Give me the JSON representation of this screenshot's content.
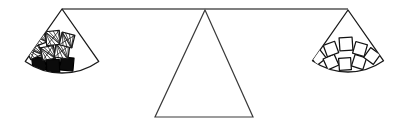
{
  "figure": {
    "background_color": "#ffffff",
    "line_color": "#1a1a1a",
    "fill_black": "#0b0b0b",
    "fill_white": "#ffffff"
  },
  "beam": {
    "label": "balance-beam",
    "left_end_x": 62,
    "right_end_x": 348,
    "y": 9,
    "tilt": "level"
  },
  "fulcrum": {
    "label": "fulcrum-triangle",
    "apex_x": 205,
    "apex_y": 10,
    "base_left_x": 155,
    "base_right_x": 253,
    "base_y": 117
  },
  "pans": [
    {
      "id": "left-pan",
      "label": "Left pan",
      "side": "left",
      "apex_x": 62,
      "apex_y": 9,
      "radius": 64,
      "start_angle_deg": 125,
      "end_angle_deg": 55,
      "block_count": 9,
      "black_block_count": 3,
      "hatched_block_count": 6,
      "blocks": [
        {
          "id": "L1",
          "fill": "black",
          "cx": 39,
          "cy": 64,
          "size": 13,
          "rotation": -8
        },
        {
          "id": "L2",
          "fill": "black",
          "cx": 53,
          "cy": 66,
          "size": 13,
          "rotation": -2
        },
        {
          "id": "L3",
          "fill": "black",
          "cx": 67,
          "cy": 64,
          "size": 13,
          "rotation": 5
        },
        {
          "id": "L4",
          "fill": "hatched",
          "cx": 34,
          "cy": 51,
          "size": 13,
          "rotation": -24
        },
        {
          "id": "L5",
          "fill": "hatched",
          "cx": 48,
          "cy": 53,
          "size": 13,
          "rotation": -10
        },
        {
          "id": "L6",
          "fill": "hatched",
          "cx": 62,
          "cy": 51,
          "size": 14,
          "rotation": 8
        },
        {
          "id": "L7",
          "fill": "hatched",
          "cx": 39,
          "cy": 38,
          "size": 13,
          "rotation": -20
        },
        {
          "id": "L8",
          "fill": "hatched",
          "cx": 53,
          "cy": 38,
          "size": 14,
          "rotation": -6
        },
        {
          "id": "L9",
          "fill": "hatched",
          "cx": 67,
          "cy": 40,
          "size": 13,
          "rotation": 14
        }
      ]
    },
    {
      "id": "right-pan",
      "label": "Right pan",
      "side": "right",
      "apex_x": 348,
      "apex_y": 10,
      "radius": 62,
      "start_angle_deg": 125,
      "end_angle_deg": 55,
      "block_count": 8,
      "black_block_count": 0,
      "white_block_count": 8,
      "blocks": [
        {
          "id": "R1",
          "fill": "white",
          "cx": 318,
          "cy": 57,
          "size": 12,
          "rotation": -38
        },
        {
          "id": "R2",
          "fill": "white",
          "cx": 331,
          "cy": 62,
          "size": 12,
          "rotation": -24
        },
        {
          "id": "R3",
          "fill": "white",
          "cx": 345,
          "cy": 64,
          "size": 12,
          "rotation": -4
        },
        {
          "id": "R4",
          "fill": "white",
          "cx": 359,
          "cy": 62,
          "size": 12,
          "rotation": 18
        },
        {
          "id": "R5",
          "fill": "white",
          "cx": 372,
          "cy": 56,
          "size": 12,
          "rotation": 36
        },
        {
          "id": "R6",
          "fill": "white",
          "cx": 331,
          "cy": 49,
          "size": 12,
          "rotation": -20
        },
        {
          "id": "R7",
          "fill": "white",
          "cx": 346,
          "cy": 44,
          "size": 13,
          "rotation": -4
        },
        {
          "id": "R8",
          "fill": "white",
          "cx": 360,
          "cy": 49,
          "size": 12,
          "rotation": 16
        }
      ]
    }
  ]
}
